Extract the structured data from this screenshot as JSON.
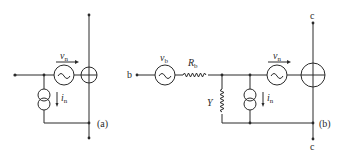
{
  "figure": {
    "panel_a": {
      "label": "(a)",
      "voltage_source": {
        "symbol": "v",
        "subscript": "n"
      },
      "current_source": {
        "symbol": "i",
        "subscript": "n"
      }
    },
    "panel_b": {
      "label": "(b)",
      "input_terminal": "b",
      "source_voltage": {
        "symbol": "v",
        "subscript": "b"
      },
      "source_resistance": {
        "symbol": "R",
        "subscript": "b"
      },
      "admittance": {
        "symbol": "Y"
      },
      "voltage_source": {
        "symbol": "v",
        "subscript": "n"
      },
      "current_source": {
        "symbol": "i",
        "subscript": "n"
      },
      "top_terminal": "c",
      "bottom_terminal": "c"
    }
  }
}
